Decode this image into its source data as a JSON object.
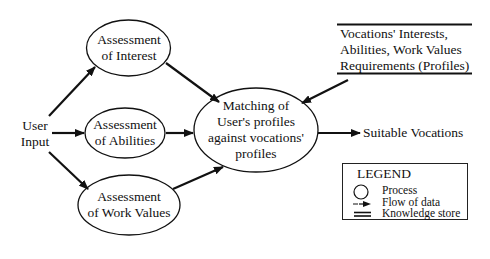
{
  "diagram": {
    "type": "data-flow",
    "nodes": {
      "user_input": {
        "line1": "User",
        "line2": "Input"
      },
      "interest": {
        "line1": "Assessment",
        "line2": "of Interest"
      },
      "abilities": {
        "line1": "Assessment",
        "line2": "of Abilities"
      },
      "work_values": {
        "line1": "Assessment",
        "line2": "of Work Values"
      },
      "matching": {
        "line1": "Matching of",
        "line2": "User's profiles",
        "line3": "against vocations'",
        "line4": "profiles"
      },
      "knowledge_store": {
        "line1": "Vocations' Interests,",
        "line2": "Abilities, Work Values",
        "line3": "Requirements (Profiles)"
      },
      "output": {
        "label": "Suitable Vocations"
      }
    },
    "edges": [
      {
        "from": "User Input",
        "to": "Assessment of Interest"
      },
      {
        "from": "User Input",
        "to": "Assessment of Abilities"
      },
      {
        "from": "User Input",
        "to": "Assessment of Work Values"
      },
      {
        "from": "Assessment of Interest",
        "to": "Matching"
      },
      {
        "from": "Assessment of Abilities",
        "to": "Matching"
      },
      {
        "from": "Assessment of Work Values",
        "to": "Matching"
      },
      {
        "from": "Vocations' Profiles",
        "to": "Matching"
      },
      {
        "from": "Matching",
        "to": "Suitable Vocations"
      }
    ],
    "legend": {
      "title": "LEGEND",
      "items": [
        {
          "symbol": "circle",
          "label": "Process"
        },
        {
          "symbol": "arrow",
          "label": "Flow of data"
        },
        {
          "symbol": "double-line",
          "label": "Knowledge store"
        }
      ]
    }
  }
}
